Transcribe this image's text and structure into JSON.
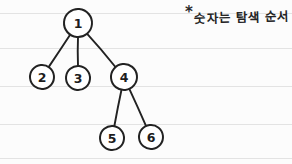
{
  "page": {
    "background_color": "#fcfcfc",
    "ink_color": "#222222",
    "rule_line_color": "#e3e3e3",
    "rule_lines_y": [
      13,
      48,
      86,
      124,
      158
    ]
  },
  "annotation": {
    "marker": "*",
    "text": "숫자는 탐색 순서"
  },
  "chart_data": {
    "type": "diagram",
    "diagram_kind": "tree",
    "title": "",
    "nodes": [
      {
        "id": "n1",
        "label": "1",
        "x": 78,
        "y": 23,
        "rx": 14,
        "ry": 14
      },
      {
        "id": "n2",
        "label": "2",
        "x": 42,
        "y": 77,
        "rx": 12,
        "ry": 12
      },
      {
        "id": "n3",
        "label": "3",
        "x": 78,
        "y": 78,
        "rx": 12,
        "ry": 12
      },
      {
        "id": "n4",
        "label": "4",
        "x": 124,
        "y": 77,
        "rx": 13,
        "ry": 13
      },
      {
        "id": "n5",
        "label": "5",
        "x": 112,
        "y": 138,
        "rx": 12,
        "ry": 12
      },
      {
        "id": "n6",
        "label": "6",
        "x": 151,
        "y": 137,
        "rx": 12,
        "ry": 12
      }
    ],
    "edges": [
      {
        "from": "n1",
        "to": "n2"
      },
      {
        "from": "n1",
        "to": "n3"
      },
      {
        "from": "n1",
        "to": "n4"
      },
      {
        "from": "n4",
        "to": "n5"
      },
      {
        "from": "n4",
        "to": "n6"
      }
    ],
    "traversal_order": [
      "1",
      "2",
      "3",
      "4",
      "5",
      "6"
    ]
  }
}
